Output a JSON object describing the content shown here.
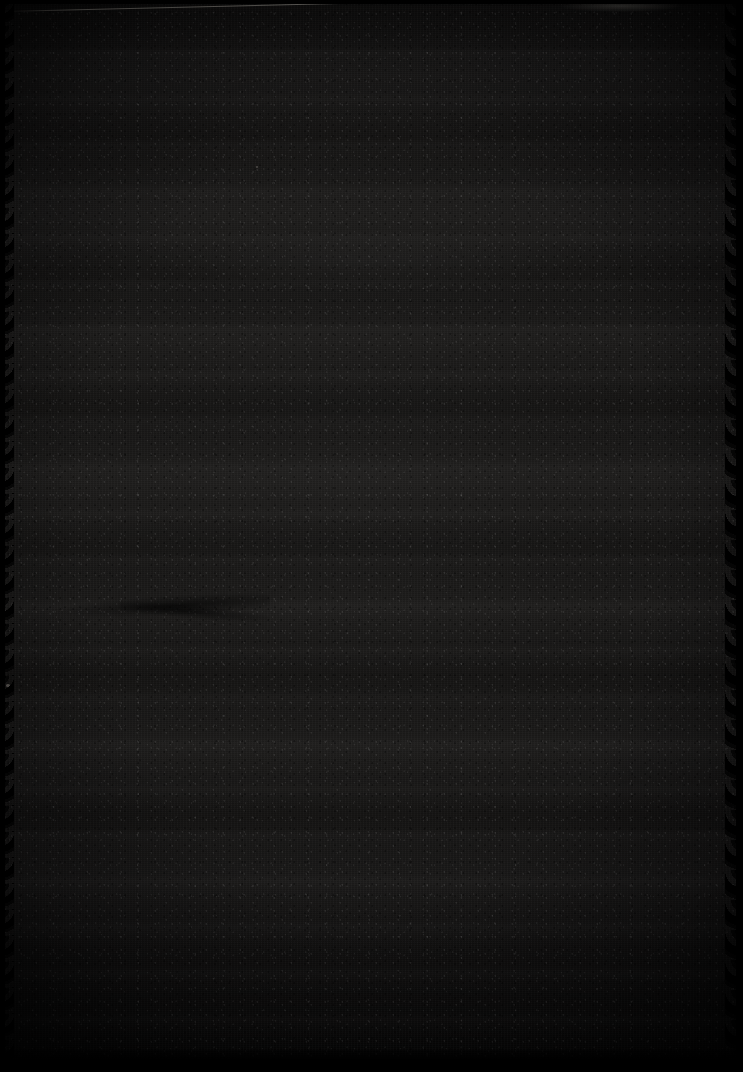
{
  "image": {
    "description": "Extremely dark, underexposed photographic frame",
    "width_px": 743,
    "height_px": 1072,
    "orientation": "portrait",
    "overall_tone": "near-black",
    "visible_text": "",
    "colors": {
      "background": "#000000",
      "base_dark": "#0c0c0c",
      "base_mid": "#171615",
      "base_light": "#1b1a19",
      "border": "#000000",
      "scratch_highlight": "#cdc8be",
      "speck": "#969188"
    },
    "features": [
      {
        "name": "diagonal-scratch",
        "label": "Thin bright diagonal scratch near the top edge",
        "x": 4,
        "y": 11,
        "width": 600,
        "height": 1,
        "rotation_deg": -1.35
      },
      {
        "name": "top-smudge",
        "label": "Faint lighter smudge at the upper right of the top edge",
        "x": 560,
        "y": 0,
        "width": 120,
        "height": 12
      },
      {
        "name": "wavy-contour",
        "label": "Faint wavy dark contour left of centre",
        "x": 30,
        "y": 596,
        "width": 240,
        "height": 26
      },
      {
        "name": "left-margin-speck",
        "label": "Tiny pale speck on the left margin",
        "x": 6,
        "y": 684,
        "width": 4,
        "height": 3
      },
      {
        "name": "upper-speck",
        "label": "Tiny pale speck in the upper middle area",
        "x": 256,
        "y": 166,
        "width": 2,
        "height": 2
      },
      {
        "name": "horizontal-banding",
        "label": "Broad horizontal exposure bands and streaking across the frame"
      },
      {
        "name": "film-grain",
        "label": "Dense fine-grain noise texture over the entire frame"
      },
      {
        "name": "scalloped-edges",
        "label": "Irregular scalloped black borders along the left and right edges"
      },
      {
        "name": "bottom-border",
        "label": "Solid black band along the bottom edge",
        "height": 22
      },
      {
        "name": "vignette",
        "label": "Heavy vignette darkening the frame corners to black"
      }
    ]
  }
}
